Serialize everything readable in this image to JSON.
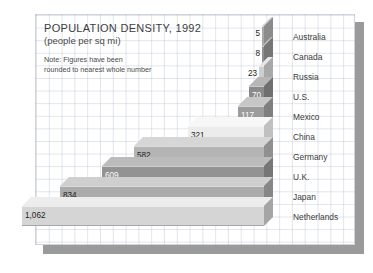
{
  "chart_data": {
    "type": "bar",
    "orientation": "horizontal",
    "style": "3d-stepped",
    "title": "POPULATION DENSITY, 1992",
    "subtitle": "(people per sq mi)",
    "note": "Note: Figures have been\nrounded to nearest whole number",
    "note_line1": "Note: Figures have been",
    "note_line2": "rounded to nearest whole number",
    "xlabel": "",
    "ylabel": "",
    "unit": "people per sq mi",
    "grid": true,
    "legend": "none",
    "categories": [
      "Australia",
      "Canada",
      "Russia",
      "U.S.",
      "Mexico",
      "China",
      "Germany",
      "U.K.",
      "Japan",
      "Netherlands"
    ],
    "values": [
      5,
      8,
      23,
      70,
      117,
      321,
      582,
      609,
      834,
      1062
    ],
    "value_labels": [
      "5",
      "8",
      "23",
      "70",
      "117",
      "321",
      "582",
      "609",
      "834",
      "1,062"
    ],
    "ylim": [
      0,
      1062
    ],
    "bars": [
      {
        "label": "Australia",
        "value": 5,
        "value_label": "5",
        "left": 262,
        "top": 26,
        "width": 2,
        "height": 20,
        "fill": "#a9a9a9",
        "top_face": "#d2d2d2",
        "side_face": "#8b8b8b",
        "label_inside": false
      },
      {
        "label": "Canada",
        "value": 8,
        "value_label": "8",
        "left": 262,
        "top": 46,
        "width": 2,
        "height": 20,
        "fill": "#8f8f8f",
        "top_face": "#bdbdbd",
        "side_face": "#757575",
        "label_inside": false
      },
      {
        "label": "Russia",
        "value": 23,
        "value_label": "23",
        "left": 259,
        "top": 66,
        "width": 5,
        "height": 20,
        "fill": "#cfcfcf",
        "top_face": "#e6e6e6",
        "side_face": "#a8a8a8",
        "label_inside": false
      },
      {
        "label": "U.S.",
        "value": 70,
        "value_label": "70",
        "left": 249,
        "top": 86,
        "width": 15,
        "height": 20,
        "fill": "#8a8a8a",
        "top_face": "#b6b6b6",
        "side_face": "#6f6f6f",
        "label_inside": true
      },
      {
        "label": "Mexico",
        "value": 117,
        "value_label": "117",
        "left": 238,
        "top": 106,
        "width": 26,
        "height": 20,
        "fill": "#9c9c9c",
        "top_face": "#c6c6c6",
        "side_face": "#7f7f7f",
        "label_inside": true
      },
      {
        "label": "China",
        "value": 321,
        "value_label": "321",
        "left": 188,
        "top": 126,
        "width": 76,
        "height": 20,
        "fill": "#ececec",
        "top_face": "#f7f7f7",
        "side_face": "#c0c0c0",
        "label_inside": true
      },
      {
        "label": "Germany",
        "value": 582,
        "value_label": "582",
        "left": 134,
        "top": 146,
        "width": 130,
        "height": 20,
        "fill": "#b4b4b4",
        "top_face": "#d6d6d6",
        "side_face": "#909090",
        "label_inside": true
      },
      {
        "label": "U.K.",
        "value": 609,
        "value_label": "609",
        "left": 102,
        "top": 166,
        "width": 162,
        "height": 20,
        "fill": "#939393",
        "top_face": "#bcbcbc",
        "side_face": "#767676",
        "label_inside": true
      },
      {
        "label": "Japan",
        "value": 834,
        "value_label": "834",
        "left": 60,
        "top": 186,
        "width": 204,
        "height": 20,
        "fill": "#ababab",
        "top_face": "#cfcfcf",
        "side_face": "#878787",
        "label_inside": true
      },
      {
        "label": "Netherlands",
        "value": 1062,
        "value_label": "1,062",
        "left": 22,
        "top": 206,
        "width": 242,
        "height": 20,
        "fill": "#d5d5d5",
        "top_face": "#ededed",
        "side_face": "#a5a5a5",
        "label_inside": true
      }
    ],
    "category_label_x": 293,
    "colors": {
      "grid": "#a0aabe",
      "shadow": "#9a9a9a",
      "text": "#3d3d3d",
      "background": "#ffffff"
    }
  }
}
